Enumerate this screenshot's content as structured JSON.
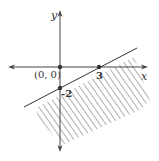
{
  "diagram": {
    "type": "linear-inequality-graph",
    "axes": {
      "x_label": "x",
      "y_label": "y"
    },
    "points": [
      {
        "label": "(0, 0)",
        "x": 0,
        "y": 0
      },
      {
        "label": "3",
        "x": 3,
        "y": 0
      },
      {
        "label": "-2",
        "x": 0,
        "y": -2
      }
    ],
    "boundary_line": {
      "through": [
        [
          0,
          -2
        ],
        [
          3,
          0
        ]
      ],
      "style": "solid"
    },
    "shaded_region": "below the line",
    "colors": {
      "axes": "#444444",
      "line": "#333333",
      "hatch": "#999999"
    }
  }
}
